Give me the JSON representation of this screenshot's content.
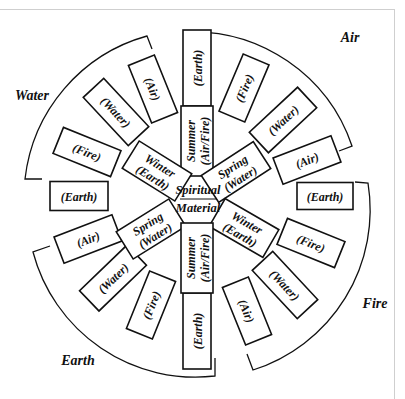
{
  "diagram": {
    "center": {
      "top_label": "Spiritual",
      "bottom_label": "Material"
    },
    "quadrant_labels": [
      {
        "id": "air",
        "text": "Air",
        "x": 350,
        "y": 42
      },
      {
        "id": "water",
        "text": "Water",
        "x": 32,
        "y": 100
      },
      {
        "id": "earth",
        "text": "Earth",
        "x": 78,
        "y": 365
      },
      {
        "id": "fire",
        "text": "Fire",
        "x": 375,
        "y": 308
      }
    ],
    "inner_boxes": [
      {
        "id": "summer-top",
        "lines": [
          "Summer",
          "(Air/Fire)"
        ],
        "cx": 197,
        "cy": 141,
        "w": 70,
        "h": 32,
        "rot": -90
      },
      {
        "id": "spring-top-right",
        "lines": [
          "Spring",
          "(Water)"
        ],
        "cx": 236,
        "cy": 172,
        "w": 62,
        "h": 32,
        "rot": -33
      },
      {
        "id": "winter-top-left",
        "lines": [
          "Winter",
          "(Earth)"
        ],
        "cx": 157,
        "cy": 171,
        "w": 62,
        "h": 32,
        "rot": 32
      },
      {
        "id": "spring-bottom-left",
        "lines": [
          "Spring",
          "(Water)"
        ],
        "cx": 151,
        "cy": 229,
        "w": 62,
        "h": 32,
        "rot": -32
      },
      {
        "id": "winter-bottom-right",
        "lines": [
          "Winter",
          "(Earth)"
        ],
        "cx": 244,
        "cy": 228,
        "w": 62,
        "h": 32,
        "rot": 30
      },
      {
        "id": "summer-bottom",
        "lines": [
          "Summer",
          "(Air/Fire)"
        ],
        "cx": 197,
        "cy": 258,
        "w": 70,
        "h": 32,
        "rot": -90
      }
    ],
    "outer_boxes": [
      {
        "id": "earth-top",
        "text": "(Earth)",
        "cx": 197,
        "cy": 68,
        "w": 76,
        "h": 28,
        "rot": -90
      },
      {
        "id": "fire-air-quad",
        "text": "(Fire)",
        "cx": 244,
        "cy": 88,
        "w": 62,
        "h": 28,
        "rot": -67
      },
      {
        "id": "water-air-quad",
        "text": "(Water)",
        "cx": 283,
        "cy": 120,
        "w": 66,
        "h": 28,
        "rot": -43
      },
      {
        "id": "air-air-quad",
        "text": "(Air)",
        "cx": 307,
        "cy": 160,
        "w": 62,
        "h": 28,
        "rot": -21
      },
      {
        "id": "earth-right",
        "text": "(Earth)",
        "cx": 325,
        "cy": 196,
        "w": 56,
        "h": 27,
        "rot": 0
      },
      {
        "id": "fire-fire-quad",
        "text": "(Fire)",
        "cx": 311,
        "cy": 243,
        "w": 62,
        "h": 28,
        "rot": 22
      },
      {
        "id": "water-fire-quad",
        "text": "(Water)",
        "cx": 285,
        "cy": 285,
        "w": 66,
        "h": 28,
        "rot": 47
      },
      {
        "id": "air-fire-quad",
        "text": "(Air)",
        "cx": 247,
        "cy": 311,
        "w": 62,
        "h": 28,
        "rot": 68
      },
      {
        "id": "earth-bottom",
        "text": "(Earth)",
        "cx": 197,
        "cy": 331,
        "w": 76,
        "h": 28,
        "rot": -90
      },
      {
        "id": "fire-earth-quad",
        "text": "(Fire)",
        "cx": 151,
        "cy": 305,
        "w": 62,
        "h": 28,
        "rot": -68
      },
      {
        "id": "water-earth-quad",
        "text": "(Water)",
        "cx": 113,
        "cy": 278,
        "w": 66,
        "h": 28,
        "rot": -44
      },
      {
        "id": "air-earth-quad",
        "text": "(Air)",
        "cx": 88,
        "cy": 239,
        "w": 62,
        "h": 28,
        "rot": -21
      },
      {
        "id": "earth-left",
        "text": "(Earth)",
        "cx": 79,
        "cy": 196,
        "w": 58,
        "h": 29,
        "rot": 0
      },
      {
        "id": "fire-water-quad",
        "text": "(Fire)",
        "cx": 87,
        "cy": 152,
        "w": 62,
        "h": 28,
        "rot": 22
      },
      {
        "id": "water-water-quad",
        "text": "(Water)",
        "cx": 116,
        "cy": 112,
        "w": 66,
        "h": 28,
        "rot": 47
      },
      {
        "id": "air-water-quad",
        "text": "(Air)",
        "cx": 153,
        "cy": 89,
        "w": 62,
        "h": 28,
        "rot": 68
      }
    ],
    "arcs": [
      {
        "id": "air-arc",
        "d": "M 185 46 L 185 32 A 168 168 0 0 1 352 146 L 339 151"
      },
      {
        "id": "water-arc",
        "d": "M 152 49 L 147 36 A 168 168 0 0 0 25 179 L 42 179"
      },
      {
        "id": "earth-arc",
        "d": "M 50 246 L 33 252 A 168 168 0 0 0 215 376 L 215 358"
      },
      {
        "id": "fire-arc",
        "d": "M 355 182 L 368 183 A 168 168 0 0 1 253 370 L 247 354"
      }
    ]
  }
}
